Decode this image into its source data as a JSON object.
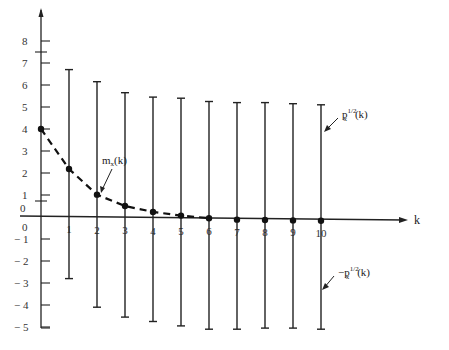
{
  "chart_data": {
    "type": "line",
    "title": "",
    "xlabel": "k",
    "ylabel": "",
    "x": [
      0,
      1,
      2,
      3,
      4,
      5,
      6,
      7,
      8,
      9,
      10
    ],
    "xlim": [
      0,
      10.5
    ],
    "ylim": [
      -5,
      8.5
    ],
    "x_ticks": [
      "0",
      "1",
      "2",
      "3",
      "4",
      "5",
      "6",
      "7",
      "8",
      "9",
      "10"
    ],
    "y_ticks": [
      "-5",
      "-4",
      "-3",
      "-2",
      "-1",
      "0",
      "1",
      "2",
      "3",
      "4",
      "5",
      "6",
      "7",
      "8"
    ],
    "grid": false,
    "legend": "none",
    "series": [
      {
        "name": "m_x(k)",
        "style": "dashed line with markers",
        "values": [
          4.0,
          2.2,
          1.05,
          0.55,
          0.3,
          0.15,
          0.05,
          0.0,
          0.0,
          0.0,
          0.0
        ]
      },
      {
        "name": "p_x^{1/2}(k)",
        "style": "upper end of vertical bar",
        "values": [
          null,
          6.7,
          6.15,
          5.65,
          5.45,
          5.4,
          5.25,
          5.2,
          5.2,
          5.15,
          5.1
        ]
      },
      {
        "name": "-p_x^{1/2}(k)",
        "style": "lower end of vertical bar",
        "values": [
          null,
          -2.8,
          -4.1,
          -4.55,
          -4.75,
          -4.95,
          -5.1,
          -5.1,
          -5.05,
          -5.05,
          -5.1
        ]
      }
    ],
    "annotations": [
      {
        "text": "m_x(k)",
        "points_to": "dashed curve near k=2"
      },
      {
        "text": "p_x^{1/2}(k)",
        "points_to": "upper portion of bar at k=10"
      },
      {
        "text": "-p_x^{1/2}(k)",
        "points_to": "lower portion of bar at k=10"
      },
      {
        "text": "0",
        "position": "left of axis, just above x-axis"
      }
    ]
  },
  "labels": {
    "x_axis": "k",
    "mean_main": "m",
    "mean_sub": "x",
    "mean_arg": "(k)",
    "upper_main": "p",
    "upper_sub": "x",
    "upper_sup": "1/2",
    "upper_arg": "(k)",
    "lower_prefix": "−p",
    "lower_sub": "x",
    "lower_sup": "1/2",
    "lower_arg": "(k)",
    "zero_above": "0"
  }
}
